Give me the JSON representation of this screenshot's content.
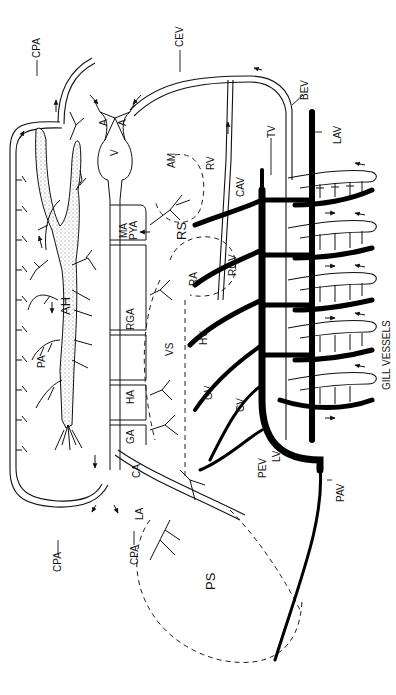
{
  "diagram": {
    "title": "",
    "orientation": "rotated 90 degrees clockwise",
    "caption_label": "GILL VESSELS",
    "labels": {
      "CPA_top": "CPA",
      "CEV": "CEV",
      "BEV": "BEV",
      "LAV": "LAV",
      "TV": "TV",
      "RV": "RV",
      "CAV": "CAV",
      "A1": "A",
      "A2": "A",
      "V": "V",
      "AM": "AM",
      "MA": "MA",
      "PYA": "PYA",
      "RS": "RS",
      "RA": "RA",
      "RGV": "RGV",
      "RGA": "RGA",
      "VS": "VS",
      "HV": "HV",
      "HA": "HA",
      "GV": "GV",
      "GA": "GA",
      "CV": "CV",
      "CA": "CA",
      "LV": "LV",
      "PEV": "PEV",
      "LA": "LA",
      "PAV": "PAV",
      "PA": "PA",
      "AH": "AH",
      "PS": "PS",
      "CPA_bottom_left": "CPA",
      "CPA_bottom_mid": "CPA"
    },
    "gill_vessels_label": "GILL VESSELS",
    "colors": {
      "ink": "#111111",
      "background": "#ffffff",
      "stipple": "#888888"
    }
  }
}
